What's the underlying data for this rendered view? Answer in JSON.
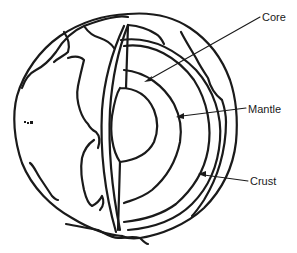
{
  "diagram": {
    "labels": {
      "core": "Core",
      "mantle": "Mantle",
      "crust": "Crust"
    },
    "layers": [
      "Crust",
      "Mantle",
      "Core"
    ],
    "colors": {
      "line": "#1a1a1a",
      "background": "#ffffff"
    }
  }
}
